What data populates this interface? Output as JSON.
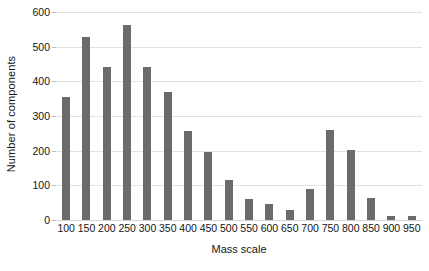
{
  "chart_data": {
    "type": "bar",
    "title": "",
    "xlabel": "Mass scale",
    "ylabel": "Number of components",
    "categories": [
      "100",
      "150",
      "200",
      "250",
      "300",
      "350",
      "400",
      "450",
      "500",
      "550",
      "600",
      "650",
      "700",
      "750",
      "800",
      "850",
      "900",
      "950"
    ],
    "values": [
      355,
      527,
      440,
      562,
      440,
      370,
      257,
      197,
      115,
      62,
      47,
      28,
      90,
      261,
      201,
      63,
      13,
      11
    ],
    "ylim": [
      0,
      600
    ],
    "yticks": [
      "600",
      "500",
      "400",
      "300",
      "200",
      "100",
      "0"
    ],
    "ytick_values": [
      600,
      500,
      400,
      300,
      200,
      100,
      0
    ],
    "grid": true,
    "legend": false,
    "colors": {
      "bar": "#6b6b6b",
      "gridline": "#e2e2e2",
      "baseline": "#d4d4d4",
      "text": "#161616",
      "background": "#ffffff"
    }
  }
}
